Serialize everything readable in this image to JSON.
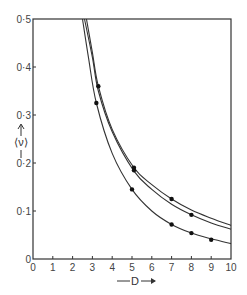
{
  "chart_data": {
    "type": "line",
    "title": "",
    "xlabel": "D",
    "ylabel": "⟨ν⟩",
    "xlim": [
      0,
      10
    ],
    "ylim": [
      0,
      0.5
    ],
    "grid": false,
    "legend": null,
    "x_ticks": [
      "0",
      "1",
      "2",
      "3",
      "4",
      "5",
      "6",
      "7",
      "8",
      "9",
      "10"
    ],
    "y_ticks": [
      "0",
      "0·1",
      "0·2",
      "0·3",
      "0·4",
      "0·5"
    ],
    "series": [
      {
        "name": "upper curve",
        "curve": [
          [
            2.7,
            0.5
          ],
          [
            3.0,
            0.43
          ],
          [
            3.3,
            0.36
          ],
          [
            4.0,
            0.27
          ],
          [
            5.1,
            0.19
          ],
          [
            6.0,
            0.155
          ],
          [
            7.0,
            0.125
          ],
          [
            8.0,
            0.102
          ],
          [
            9.0,
            0.085
          ],
          [
            10.0,
            0.07
          ]
        ],
        "points": [
          [
            3.3,
            0.36
          ],
          [
            5.1,
            0.19
          ],
          [
            7.0,
            0.125
          ]
        ]
      },
      {
        "name": "middle curve",
        "curve": [
          [
            2.6,
            0.5
          ],
          [
            3.0,
            0.42
          ],
          [
            3.3,
            0.35
          ],
          [
            4.0,
            0.265
          ],
          [
            5.1,
            0.183
          ],
          [
            6.0,
            0.145
          ],
          [
            7.0,
            0.114
          ],
          [
            8.0,
            0.092
          ],
          [
            9.0,
            0.075
          ],
          [
            10.0,
            0.062
          ]
        ],
        "points": [
          [
            5.1,
            0.185
          ],
          [
            8.0,
            0.092
          ]
        ]
      },
      {
        "name": "lower curve",
        "curve": [
          [
            2.5,
            0.5
          ],
          [
            2.8,
            0.42
          ],
          [
            3.2,
            0.325
          ],
          [
            4.0,
            0.22
          ],
          [
            5.0,
            0.145
          ],
          [
            6.0,
            0.1
          ],
          [
            7.0,
            0.072
          ],
          [
            8.0,
            0.054
          ],
          [
            9.0,
            0.042
          ],
          [
            10.0,
            0.032
          ]
        ],
        "points": [
          [
            3.2,
            0.325
          ],
          [
            5.0,
            0.145
          ],
          [
            7.0,
            0.072
          ],
          [
            8.0,
            0.054
          ],
          [
            9.0,
            0.04
          ]
        ]
      }
    ]
  },
  "labels": {
    "x_axis": "D",
    "y_axis": "⟨ν⟩"
  }
}
